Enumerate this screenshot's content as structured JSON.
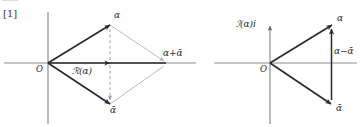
{
  "figure": {
    "index_label": "[1]",
    "width": 361,
    "height": 127,
    "background_color": "#ffffff",
    "ink_color": "#2b2b2b",
    "axis_color": "#8c8c8c",
    "faint_line_color": "#b3b3b3",
    "dashed_line_color": "#9a9a9a"
  },
  "left_diagram": {
    "name": "rhombus-alpha-plus-alpha-bar",
    "origin_label": "O",
    "vertex_alpha_label": "α",
    "vertex_alpha_bar_label": "ᾱ",
    "resultant_label": "α+ᾱ",
    "real_part_label": "ℛ(α)",
    "points": {
      "origin": [
        48,
        63
      ],
      "alpha": [
        110,
        25
      ],
      "alpha_bar": [
        110,
        104
      ],
      "sum": [
        166,
        63
      ]
    },
    "axes": {
      "horizontal_y": 63,
      "horizontal_x_start": 4,
      "horizontal_x_end": 196,
      "vertical_x": 48,
      "vertical_y_start": 12,
      "vertical_y_end": 124
    }
  },
  "right_diagram": {
    "name": "triangle-alpha-minus-alpha-bar",
    "origin_label": "O",
    "vertex_alpha_label": "α",
    "vertex_alpha_bar_label": "ᾱ",
    "difference_label": "α−ᾱ",
    "imaginary_axis_label": "ℐ(α)i",
    "points": {
      "origin": [
        270,
        63
      ],
      "alpha": [
        332,
        25
      ],
      "alpha_bar": [
        331,
        104
      ]
    },
    "axes": {
      "horizontal_y": 63,
      "horizontal_x_start": 214,
      "horizontal_x_end": 357,
      "vertical_x": 270,
      "vertical_y_start": 22,
      "vertical_y_end": 124
    }
  }
}
